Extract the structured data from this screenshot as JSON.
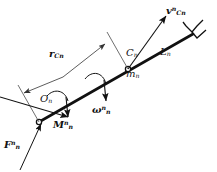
{
  "figure": {
    "stroke_color": "#111111",
    "thin_stroke_color": "#555555",
    "background": "#ffffff",
    "labels": {
      "velocity": {
        "symbol": "v",
        "sup": "n",
        "sub": "Cn",
        "bold": true
      },
      "link_length": {
        "symbol": "L",
        "sup": "",
        "sub": "n",
        "bold": false
      },
      "centroid": {
        "symbol": "C",
        "sup": "",
        "sub": "n",
        "bold": false
      },
      "mass": {
        "symbol": "m",
        "sup": "",
        "sub": "n",
        "bold": false
      },
      "position_vector": {
        "symbol": "r",
        "sup": "",
        "sub": "Cn",
        "bold": true
      },
      "origin": {
        "symbol": "O",
        "sup": "",
        "sub": "n",
        "bold": false
      },
      "angular_velocity": {
        "symbol": "ω",
        "sup": "n",
        "sub": "n",
        "bold": false
      },
      "moment": {
        "symbol": "M",
        "sup": "n",
        "sub": "n",
        "bold": true
      },
      "force": {
        "symbol": "F",
        "sup": "n",
        "sub": "n",
        "bold": true
      }
    }
  }
}
